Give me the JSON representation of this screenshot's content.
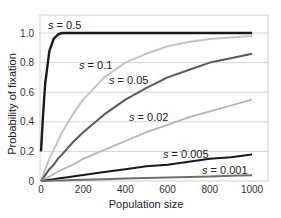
{
  "chart_data": {
    "type": "line",
    "title": "",
    "xlabel": "Population size",
    "ylabel": "Probability of fixation",
    "xlim": [
      0,
      1000
    ],
    "ylim": [
      0,
      1.0
    ],
    "grid": true,
    "legend_position": "inline labels",
    "x_ticks": [
      0,
      200,
      400,
      600,
      800,
      1000
    ],
    "x_tick_labels": [
      "0",
      "200",
      "400",
      "600",
      "800",
      "1000"
    ],
    "y_ticks": [
      0,
      0.2,
      0.4,
      0.6,
      0.8,
      1.0
    ],
    "y_tick_labels": [
      "0",
      "0.2",
      "0.4",
      "0.6",
      "0.8",
      "1.0"
    ],
    "x": [
      0,
      10,
      20,
      40,
      60,
      80,
      100,
      150,
      200,
      300,
      400,
      500,
      600,
      700,
      800,
      900,
      1000
    ],
    "series": [
      {
        "name": "s = 0.5",
        "label": "s = 0.5",
        "color": "#1a1a1a",
        "width": 2.4,
        "label_pos": [
          48,
          29
        ],
        "values": [
          0.2,
          0.45,
          0.66,
          0.88,
          0.96,
          0.99,
          1.0,
          1.0,
          1.0,
          1.0,
          1.0,
          1.0,
          1.0,
          1.0,
          1.0,
          1.0,
          1.0
        ]
      },
      {
        "name": "s = 0.1",
        "label": "s = 0.1",
        "color": "#c4c4c4",
        "width": 2.0,
        "label_pos": [
          79,
          69
        ],
        "values": [
          0,
          0.04,
          0.08,
          0.15,
          0.21,
          0.27,
          0.33,
          0.45,
          0.55,
          0.7,
          0.8,
          0.86,
          0.91,
          0.94,
          0.96,
          0.97,
          0.98
        ]
      },
      {
        "name": "s = 0.05",
        "label": "s = 0.05",
        "color": "#5a5a5a",
        "width": 2.0,
        "label_pos": [
          109,
          84
        ],
        "values": [
          0,
          0.02,
          0.04,
          0.08,
          0.11,
          0.15,
          0.18,
          0.26,
          0.33,
          0.45,
          0.55,
          0.63,
          0.7,
          0.75,
          0.8,
          0.83,
          0.86
        ]
      },
      {
        "name": "s = 0.02",
        "label": "s = 0.02",
        "color": "#b5b5b5",
        "width": 1.8,
        "label_pos": [
          129,
          121
        ],
        "values": [
          0,
          0.008,
          0.016,
          0.03,
          0.047,
          0.062,
          0.077,
          0.11,
          0.15,
          0.21,
          0.27,
          0.33,
          0.38,
          0.43,
          0.47,
          0.51,
          0.55
        ]
      },
      {
        "name": "s = 0.005",
        "label": "s = 0.005",
        "color": "#1a1a1a",
        "width": 2.0,
        "label_pos": [
          163,
          158
        ],
        "values": [
          0,
          0.002,
          0.004,
          0.008,
          0.012,
          0.016,
          0.02,
          0.03,
          0.04,
          0.06,
          0.08,
          0.1,
          0.11,
          0.13,
          0.15,
          0.16,
          0.18
        ]
      },
      {
        "name": "s = 0.001",
        "label": "s = 0.001",
        "color": "#6e6e6e",
        "width": 2.0,
        "label_pos": [
          202,
          174
        ],
        "values": [
          0,
          0.0004,
          0.0008,
          0.0016,
          0.0024,
          0.0032,
          0.004,
          0.006,
          0.008,
          0.012,
          0.016,
          0.02,
          0.024,
          0.028,
          0.031,
          0.035,
          0.039
        ]
      }
    ]
  }
}
